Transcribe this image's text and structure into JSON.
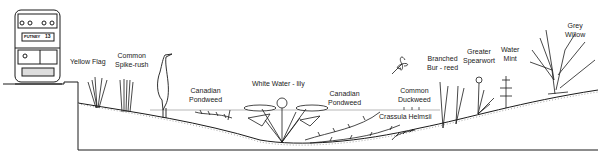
{
  "diagram": {
    "title": "",
    "bus": {
      "destination": "PUTNEY",
      "route": "13"
    },
    "labels": [
      {
        "id": "yellow-flag",
        "text": "Yellow Flag",
        "x": 70,
        "y": 58
      },
      {
        "id": "common-spike-rush",
        "text": "Common\nSpike-rush",
        "x": 115,
        "y": 52
      },
      {
        "id": "canadian-pondweed-1",
        "text": "Canadian\nPondweed",
        "x": 189,
        "y": 87
      },
      {
        "id": "white-water-lily",
        "text": "White Water - lily",
        "x": 252,
        "y": 80
      },
      {
        "id": "canadian-pondweed-2",
        "text": "Canadian\nPondweed",
        "x": 328,
        "y": 90
      },
      {
        "id": "common-duckweed",
        "text": "Common\nDuckweed",
        "x": 398,
        "y": 87
      },
      {
        "id": "crassula-helmsii",
        "text": "Crassula Helmsii",
        "x": 379,
        "y": 116
      },
      {
        "id": "branched-bur-reed",
        "text": "Branched\nBur - reed",
        "x": 427,
        "y": 55
      },
      {
        "id": "greater-spearwort",
        "text": "Greater\nSpearwort",
        "x": 463,
        "y": 48
      },
      {
        "id": "water-mint",
        "text": "Water\nMint",
        "x": 501,
        "y": 46
      },
      {
        "id": "grey-willow",
        "text": "Grey\nWillow",
        "x": 565,
        "y": 22
      }
    ],
    "colors": {
      "line": "#1a1a1a",
      "water": "#9a9a9a",
      "stipple": "#b0b0b0"
    }
  }
}
